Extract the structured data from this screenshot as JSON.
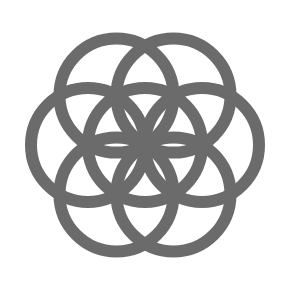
{
  "figure": {
    "title": "Seed of Life",
    "stroke_color": "#6b6b6b",
    "background": "#ffffff",
    "center": [
      145,
      145
    ],
    "radius": 57,
    "stroke_width": 12,
    "circles": [
      {
        "name": "center",
        "cx": 145,
        "cy": 145
      },
      {
        "name": "right",
        "cx": 202,
        "cy": 145
      },
      {
        "name": "lower-right",
        "cx": 173.5,
        "cy": 194.4
      },
      {
        "name": "lower-left",
        "cx": 116.5,
        "cy": 194.4
      },
      {
        "name": "left",
        "cx": 88,
        "cy": 145
      },
      {
        "name": "upper-left",
        "cx": 116.5,
        "cy": 95.6
      },
      {
        "name": "upper-right",
        "cx": 173.5,
        "cy": 95.6
      }
    ]
  }
}
